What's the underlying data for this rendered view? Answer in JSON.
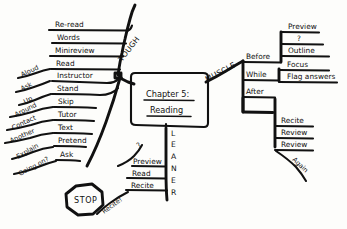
{
  "diagram": {
    "title": "Chapter 5: Reading",
    "type": "hand-drawn-mind-map",
    "background_color": "#fdfdfb",
    "ink_color": "#111111"
  },
  "core": {
    "line1": "Chapter 5:",
    "line2": "Reading"
  },
  "branch_tough": {
    "label": "TOUGH",
    "items": [
      {
        "text": "Re-read"
      },
      {
        "text": "Words"
      },
      {
        "text": "Minireview"
      },
      {
        "text": "Read",
        "modifier": "Aloud"
      },
      {
        "text": "Instructor",
        "modifier": "Ask"
      },
      {
        "text": "Stand",
        "modifier": "Up"
      },
      {
        "text": "Skip",
        "modifier": "Around"
      },
      {
        "text": "Tutor",
        "modifier": "Contact"
      },
      {
        "text": "Text",
        "modifier": "Another"
      },
      {
        "text": "Pretend",
        "modifier": "Explain"
      },
      {
        "text": "Ask",
        "modifier": "Going on?"
      }
    ]
  },
  "stop_sign": {
    "label": "STOP"
  },
  "branch_leaner": {
    "letters": [
      "L",
      "E",
      "A",
      "N",
      "E",
      "R"
    ],
    "items": [
      {
        "text": "Preview"
      },
      {
        "text": "Read"
      },
      {
        "text": "Recite"
      }
    ],
    "question_mark": "?",
    "recite_note": "Recite!"
  },
  "branch_muscle": {
    "label": "MUSCLE",
    "phases": [
      {
        "name": "Before",
        "items": [
          {
            "text": "Preview"
          },
          {
            "text": "?"
          },
          {
            "text": "Outline"
          }
        ]
      },
      {
        "name": "While",
        "items": [
          {
            "text": "Focus"
          },
          {
            "text": "Flag answers"
          }
        ]
      },
      {
        "name": "After",
        "items": [
          {
            "text": "Recite"
          },
          {
            "text": "Review"
          },
          {
            "text": "Review"
          }
        ],
        "note": "Again"
      }
    ]
  }
}
